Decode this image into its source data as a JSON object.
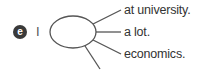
{
  "exercise": {
    "item_letter": "e",
    "prompt": "I",
    "options": [
      "at university.",
      "a lot.",
      "economics."
    ]
  }
}
